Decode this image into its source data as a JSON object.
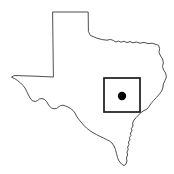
{
  "figure": {
    "background_color": "#ffffff",
    "width": 174,
    "height": 174
  },
  "state": {
    "name": "Texas",
    "outline_color": "#3a3a3a",
    "fill_color": "#ffffff",
    "outline_width": 0.9,
    "outline_path": "M 53.0 12.0 L 88.2 12.0 L 88.4 31.5 L 90.5 35.5 L 94.0 37.0 L 98.0 38.5 L 102.5 39.6 L 107.0 40.2 L 110.5 39.4 L 113.5 40.6 L 116.0 42.0 L 118.5 41.0 L 121.0 42.2 L 124.0 41.2 L 127.0 42.6 L 130.0 41.6 L 133.0 42.8 L 136.5 42.0 L 140.0 43.2 L 144.0 42.4 L 148.0 43.6 L 152.0 43.2 L 156.0 44.4 L 158.6 45.4 L 159.6 48.5 L 159.0 52.5 L 160.6 56.0 L 162.6 59.0 L 163.4 63.0 L 162.4 66.5 L 163.6 70.0 L 165.6 73.0 L 166.4 77.0 L 165.0 80.5 L 163.4 84.0 L 162.8 88.0 L 161.4 91.5 L 159.0 94.5 L 156.4 97.5 L 153.6 100.5 L 151.0 103.5 L 149.0 106.5 L 147.0 109.0 L 144.0 110.5 L 141.0 112.5 L 138.6 115.0 L 136.2 117.5 L 134.0 120.0 L 132.6 123.0 L 133.0 126.0 L 131.4 128.5 L 132.0 131.0 L 130.4 133.0 L 131.0 135.5 L 129.4 137.5 L 130.0 140.0 L 128.4 142.0 L 129.0 144.5 L 127.6 147.0 L 128.2 149.5 L 127.0 152.0 L 127.6 155.0 L 126.4 158.0 L 127.0 161.0 L 126.0 164.0 L 124.0 165.6 L 121.5 164.0 L 119.0 161.0 L 117.5 157.5 L 116.5 153.5 L 115.5 149.5 L 114.0 146.0 L 112.0 143.0 L 109.5 141.0 L 106.5 139.6 L 103.5 138.0 L 100.0 136.4 L 96.5 134.6 L 93.0 132.6 L 89.5 130.4 L 86.5 128.0 L 83.5 125.0 L 81.0 122.0 L 78.5 119.0 L 76.5 116.0 L 75.0 113.0 L 73.0 110.5 L 70.5 108.5 L 68.0 107.0 L 65.5 106.0 L 63.0 105.2 L 60.5 105.6 L 58.5 107.0 L 56.5 108.4 L 54.0 108.8 L 51.5 108.0 L 49.5 106.2 L 48.0 104.0 L 46.5 101.5 L 44.5 99.5 L 42.0 98.5 L 39.5 99.0 L 37.5 100.5 L 35.5 101.5 L 33.0 101.0 L 31.0 99.5 L 29.5 97.0 L 28.0 94.0 L 26.5 91.0 L 25.0 88.0 L 23.0 85.5 L 20.5 83.0 L 17.5 80.5 L 14.5 78.5 L 11.5 77.2 L 14.0 75.6 L 18.0 75.6 L 23.0 75.8 L 29.0 76.0 L 36.0 76.2 L 44.0 76.6 L 53.0 77.0 Z"
  },
  "inset": {
    "label": "study area box",
    "stroke_color": "#1a1a1a",
    "stroke_width": 1.7,
    "x": 104,
    "y": 78,
    "width": 36,
    "height": 34
  },
  "site_marker": {
    "label": "site location dot",
    "color": "#000000",
    "cx": 122,
    "cy": 96,
    "r": 4.2
  }
}
